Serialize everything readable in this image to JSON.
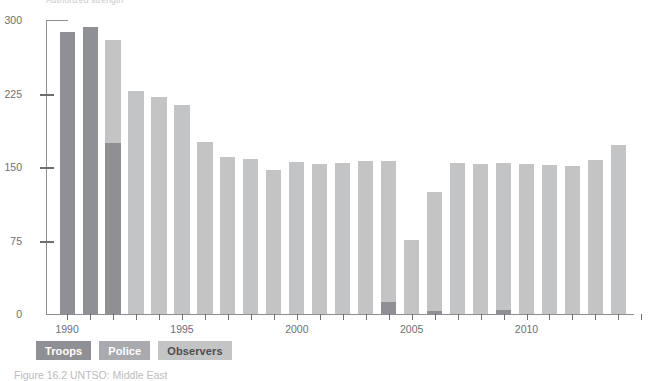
{
  "caption": "Figure 16.2 UNTSO: Middle East",
  "top_clipped_text": "Authorized strength",
  "legend": {
    "items": [
      {
        "label": "Troops",
        "color": "#8f9093"
      },
      {
        "label": "Police",
        "color": "#a9aaad"
      },
      {
        "label": "Observers",
        "color": "#c3c4c6"
      }
    ]
  },
  "axis": {
    "y_ticks": [
      "300",
      "225",
      "150",
      "75",
      "0"
    ],
    "x_ticks": [
      "1990",
      "1995",
      "2000",
      "2005",
      "2010"
    ]
  },
  "chart_data": {
    "type": "bar",
    "stacked": true,
    "title": "Figure 16.2 UNTSO: Middle East",
    "xlabel": "",
    "ylabel": "",
    "ylim": [
      0,
      300
    ],
    "ytick_values": [
      0,
      75,
      150,
      225,
      300
    ],
    "grid": false,
    "legend_position": "bottom-left",
    "categories": [
      "1990",
      "1991",
      "1992",
      "1993",
      "1994",
      "1995",
      "1996",
      "1997",
      "1998",
      "1999",
      "2000",
      "2001",
      "2002",
      "2003",
      "2004",
      "2005",
      "2006",
      "2007",
      "2008",
      "2009",
      "2010",
      "2011",
      "2012",
      "2013",
      "2014"
    ],
    "series": [
      {
        "name": "Troops",
        "color": "#8f9093",
        "values": [
          288,
          293,
          175,
          0,
          0,
          0,
          0,
          0,
          0,
          0,
          0,
          0,
          0,
          0,
          12,
          0,
          3,
          0,
          0,
          4,
          0,
          0,
          0,
          0,
          0
        ]
      },
      {
        "name": "Police",
        "color": "#a9aaad",
        "values": [
          0,
          0,
          0,
          0,
          0,
          0,
          0,
          0,
          0,
          0,
          0,
          0,
          0,
          0,
          0,
          0,
          0,
          0,
          0,
          0,
          0,
          0,
          0,
          0,
          0
        ]
      },
      {
        "name": "Observers",
        "color": "#c3c4c6",
        "values": [
          0,
          0,
          105,
          228,
          221,
          213,
          176,
          160,
          158,
          147,
          155,
          153,
          154,
          156,
          144,
          76,
          121,
          154,
          153,
          150,
          153,
          152,
          151,
          157,
          172
        ]
      }
    ],
    "totals": [
      288,
      293,
      280,
      228,
      221,
      213,
      176,
      160,
      158,
      147,
      155,
      153,
      154,
      156,
      156,
      76,
      124,
      154,
      153,
      154,
      153,
      152,
      151,
      157,
      172
    ]
  }
}
